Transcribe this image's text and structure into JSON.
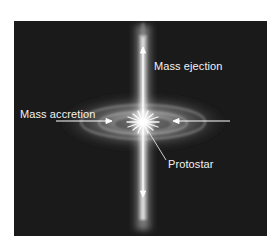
{
  "figure": {
    "background_color": "#1a1a1a",
    "labels": {
      "ejection": "Mass ejection",
      "accretion": "Mass accretion",
      "protostar": "Protostar"
    },
    "elements": {
      "jet": "bipolar-jet",
      "disk": "accretion-disk",
      "star": "protostar-glow"
    }
  }
}
